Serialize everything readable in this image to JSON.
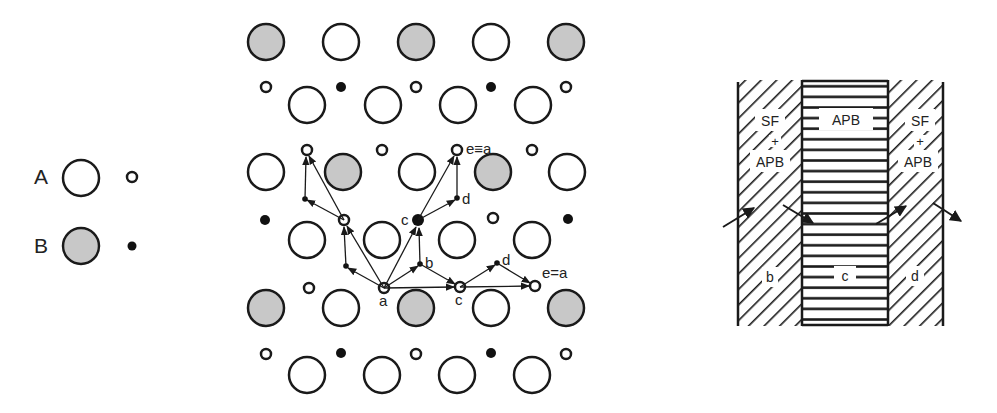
{
  "colors": {
    "stroke": "#1a1a1a",
    "atom_a_fill": "#ffffff",
    "atom_b_fill": "#c8c8c8",
    "background": "#ffffff"
  },
  "legend": {
    "items": [
      {
        "label": "A",
        "large_fill": "white",
        "small_fill": "white"
      },
      {
        "label": "B",
        "large_fill": "gray",
        "small_fill": "black"
      }
    ]
  },
  "lattice": {
    "labels": {
      "top_e": "e≡a",
      "top_d": "d",
      "mid_c": "c",
      "mid_b": "b",
      "bottom_a": "a",
      "bottom_c": "c",
      "bottom_d": "d",
      "bottom_e": "e=a"
    }
  },
  "fault_diagram": {
    "left_region": {
      "line1": "SF",
      "line2": "+",
      "line3": "APB",
      "bottom": "b"
    },
    "middle_region": {
      "top": "APB",
      "bottom": "c"
    },
    "right_region": {
      "line1": "SF",
      "line2": "+",
      "line3": "APB",
      "bottom": "d"
    }
  }
}
